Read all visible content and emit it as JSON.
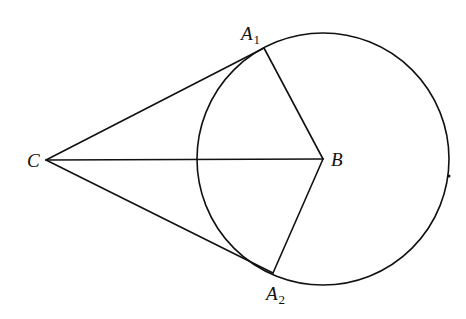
{
  "diagram": {
    "type": "geometry",
    "stroke_color": "#111111",
    "background": "#ffffff",
    "circle": {
      "center_label": "B",
      "cx": 323,
      "cy": 159,
      "r": 126
    },
    "points": [
      {
        "id": "C",
        "label": "C",
        "subscript": "",
        "x": 46,
        "y": 160,
        "label_x": 27,
        "label_y": 167
      },
      {
        "id": "B",
        "label": "B",
        "subscript": "",
        "x": 323,
        "y": 159,
        "label_x": 331,
        "label_y": 166
      },
      {
        "id": "A1",
        "label": "A",
        "subscript": "1",
        "x": 264,
        "y": 48,
        "label_x": 241,
        "label_y": 40
      },
      {
        "id": "A2",
        "label": "A",
        "subscript": "2",
        "x": 273,
        "y": 273,
        "label_x": 266,
        "label_y": 300
      }
    ],
    "segments": [
      {
        "name": "segment-CA1",
        "from": "C",
        "to": "A1"
      },
      {
        "name": "segment-CA2",
        "from": "C",
        "to": "A2"
      },
      {
        "name": "segment-CB",
        "from": "C",
        "to": "B"
      },
      {
        "name": "segment-BA1",
        "from": "B",
        "to": "A1"
      },
      {
        "name": "segment-BA2",
        "from": "B",
        "to": "A2"
      }
    ],
    "marks": [
      {
        "name": "circle-mark-dot",
        "x": 449,
        "y": 176,
        "r": 1.5
      }
    ]
  }
}
